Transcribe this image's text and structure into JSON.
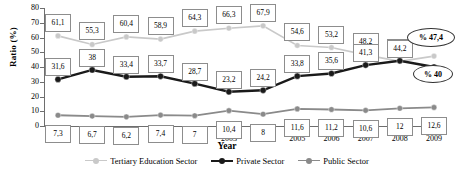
{
  "chart_data": {
    "type": "line",
    "title": "",
    "xlabel": "Year",
    "ylabel": "Ratio (%)",
    "ylim": [
      0,
      80
    ],
    "yticks": [
      "0",
      "10",
      "20",
      "30",
      "40",
      "50",
      "60",
      "70",
      "80"
    ],
    "grid": false,
    "legend_position": "bottom",
    "categories": [
      "1998",
      "1999",
      "2000",
      "2001",
      "2002",
      "2003",
      "2004",
      "2005",
      "2006",
      "2007",
      "2008",
      "2009"
    ],
    "series": [
      {
        "name": "Tertiary Education Sector",
        "color": "#c9c9c9",
        "values": [
          61.1,
          55.3,
          60.4,
          58.9,
          64.3,
          66.3,
          67.9,
          54.6,
          53.2,
          48.2,
          43.8,
          47.4
        ],
        "labels": [
          "61,1",
          "55,3",
          "60,4",
          "58,9",
          "64,3",
          "66,3",
          "67,9",
          "54,6",
          "53,2",
          "48,2",
          "43,8",
          ""
        ]
      },
      {
        "name": "Private Sector",
        "color": "#1a1a1a",
        "values": [
          31.6,
          38.0,
          33.4,
          33.7,
          28.7,
          23.2,
          24.2,
          33.8,
          35.6,
          41.3,
          44.2,
          40.0
        ],
        "labels": [
          "31,6",
          "38",
          "33,4",
          "33,7",
          "28,7",
          "23,2",
          "24,2",
          "33,8",
          "35,6",
          "41,3",
          "44,2",
          ""
        ]
      },
      {
        "name": "Public Sector",
        "color": "#8a8a8a",
        "values": [
          7.3,
          6.7,
          6.2,
          7.4,
          7.0,
          10.4,
          8.0,
          11.6,
          11.2,
          10.6,
          12.0,
          12.6
        ],
        "labels": [
          "7,3",
          "6,7",
          "6,2",
          "7,4",
          "7",
          "10,4",
          "8",
          "11,6",
          "11,2",
          "10,6",
          "12",
          "12,6"
        ]
      }
    ],
    "annotations": [
      {
        "text": "% 47,4",
        "series": "Tertiary Education Sector",
        "at": "2009"
      },
      {
        "text": "% 40",
        "series": "Private Sector",
        "at": "2009"
      }
    ]
  }
}
